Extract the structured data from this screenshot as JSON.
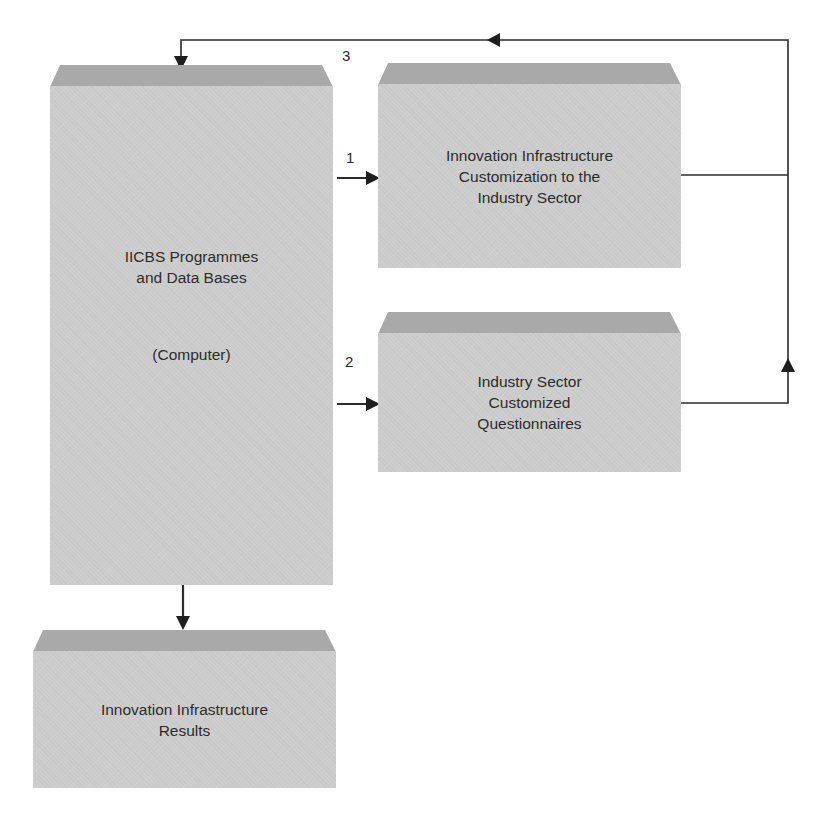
{
  "diagram": {
    "colors": {
      "box_front": "#cdcdcd",
      "box_top": "#a9a9a9",
      "line": "#2b2b2b",
      "text": "#2a2a2a",
      "background": "#ffffff"
    },
    "boxes": {
      "main": {
        "lines": [
          "IICBS Programmes",
          "and Data Bases",
          "",
          "",
          "(Computer)"
        ]
      },
      "customization": {
        "lines": [
          "Innovation Infrastructure",
          "Customization to the",
          "Industry Sector"
        ]
      },
      "questionnaires": {
        "lines": [
          "Industry Sector",
          "Customized",
          "Questionnaires"
        ]
      },
      "results": {
        "lines": [
          "Innovation Infrastructure",
          "Results"
        ]
      }
    },
    "arrow_labels": {
      "arrow1": "1",
      "arrow2": "2",
      "arrow3": "3"
    },
    "edges": [
      {
        "from": "main",
        "to": "customization",
        "label": "1"
      },
      {
        "from": "main",
        "to": "questionnaires",
        "label": "2"
      },
      {
        "from": "customization",
        "to": "main",
        "label": "3",
        "via": "right feedback loop"
      },
      {
        "from": "questionnaires",
        "to": "main",
        "label": "3",
        "via": "right feedback loop"
      },
      {
        "from": "main",
        "to": "results",
        "label": ""
      }
    ]
  }
}
